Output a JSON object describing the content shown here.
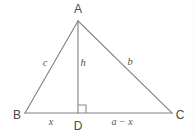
{
  "figure": {
    "type": "geometry-diagram",
    "background_color": "#ffffff",
    "line_color": "#808080",
    "label_color": "#4a4a4a",
    "vertices": [
      {
        "name": "A",
        "label": "A",
        "x": 78,
        "y": 21,
        "label_x": 78,
        "label_y": 9
      },
      {
        "name": "B",
        "label": "B",
        "x": 25,
        "y": 113,
        "label_x": 17,
        "label_y": 115
      },
      {
        "name": "C",
        "label": "C",
        "x": 172,
        "y": 113,
        "label_x": 180,
        "label_y": 115
      },
      {
        "name": "D",
        "label": "D",
        "x": 78,
        "y": 113,
        "label_x": 78,
        "label_y": 126
      }
    ],
    "sides": [
      {
        "name": "side-c",
        "label": "c",
        "label_x": 45,
        "label_y": 63,
        "from": "B",
        "to": "A"
      },
      {
        "name": "altitude-h",
        "label": "h",
        "label_x": 83,
        "label_y": 63,
        "from": "A",
        "to": "D"
      },
      {
        "name": "side-b",
        "label": "b",
        "label_x": 130,
        "label_y": 62,
        "from": "A",
        "to": "C"
      }
    ],
    "segments": [
      {
        "name": "segment-bd",
        "label": "x",
        "label_x": 51,
        "label_y": 122,
        "from": "B",
        "to": "D"
      },
      {
        "name": "segment-dc",
        "label": "a − x",
        "label_x": 122,
        "label_y": 122,
        "from": "D",
        "to": "C"
      }
    ],
    "right_angle": {
      "name": "right-angle-marker",
      "at": "D",
      "size": 7
    }
  }
}
